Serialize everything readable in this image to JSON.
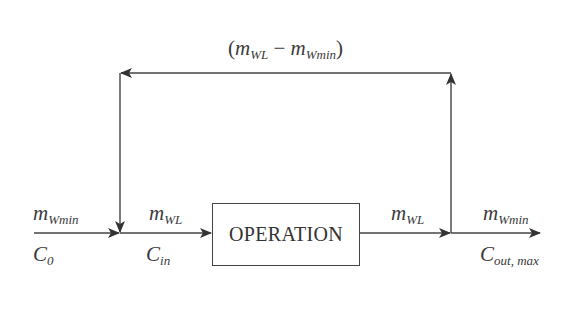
{
  "diagram": {
    "recycle_label": {
      "open": "(",
      "term1_base": "m",
      "term1_sub": "WL",
      "minus": " − ",
      "term2_base": "m",
      "term2_sub": "Wmin",
      "close": ")"
    },
    "process_box": {
      "label": "OPERATION"
    },
    "inlet": {
      "flow_base": "m",
      "flow_sub": "Wmin",
      "conc_base": "C",
      "conc_sub": "0"
    },
    "mixed_inlet": {
      "flow_base": "m",
      "flow_sub": "WL",
      "conc_base": "C",
      "conc_sub": "in"
    },
    "process_outlet": {
      "flow_base": "m",
      "flow_sub": "WL"
    },
    "final_outlet": {
      "flow_base": "m",
      "flow_sub": "Wmin",
      "conc_base": "C",
      "conc_sub": "out, max"
    },
    "colors": {
      "line": "#444444",
      "text": "#3a3a3a",
      "background": "#ffffff"
    }
  }
}
